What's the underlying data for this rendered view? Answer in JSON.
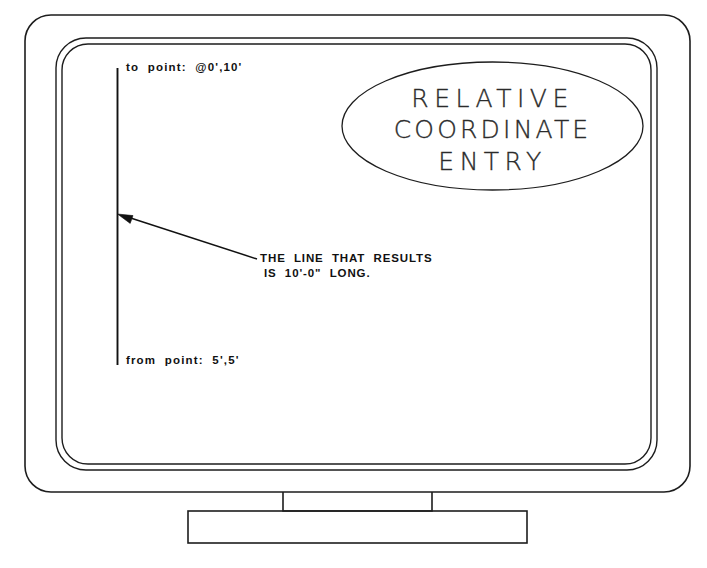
{
  "figure": {
    "type": "line-art-illustration",
    "background_color": "#ffffff",
    "ink_color": "#111111"
  },
  "monitor": {
    "bezel_label": "monitor-bezel",
    "screen_label": "monitor-screen",
    "stand_neck_label": "monitor-stand-neck",
    "stand_base_label": "monitor-stand-base"
  },
  "screen": {
    "title_ellipse": {
      "lines": [
        "RELATIVE",
        "COORDINATE",
        "ENTRY"
      ]
    },
    "prompts": {
      "to_point": "to  point:  @0',10'",
      "from_point": "from  point:  5',5'"
    },
    "annotation": {
      "line1": "THE  LINE  THAT  RESULTS",
      "line2": "IS  10'-0\"  LONG."
    },
    "drawn_line": {
      "name": "vertical-line-segment",
      "from_point": "5',5'",
      "to_point": "@0',10'",
      "resulting_length": "10'-0\""
    }
  }
}
